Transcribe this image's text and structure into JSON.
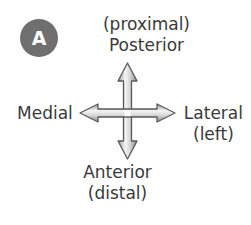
{
  "figure": {
    "panel_label": "A",
    "background_color": "#ffffff",
    "badge_color": "#6f6f6f",
    "badge_text_color": "#ffffff",
    "label_color": "#3a3a3a",
    "arrow_outline_color": "#555555",
    "arrow_fill_light": "#f2f2f2",
    "arrow_fill_dark": "#8d8d8d"
  },
  "orientation_key": {
    "up": {
      "icon": "arrow-up-icon",
      "primary": "Posterior",
      "secondary": "(proximal)"
    },
    "down": {
      "icon": "arrow-down-icon",
      "primary": "Anterior",
      "secondary": "(distal)"
    },
    "left": {
      "icon": "arrow-left-icon",
      "primary": "Medial",
      "secondary": ""
    },
    "right": {
      "icon": "arrow-right-icon",
      "primary": "Lateral",
      "secondary": "(left)"
    }
  }
}
